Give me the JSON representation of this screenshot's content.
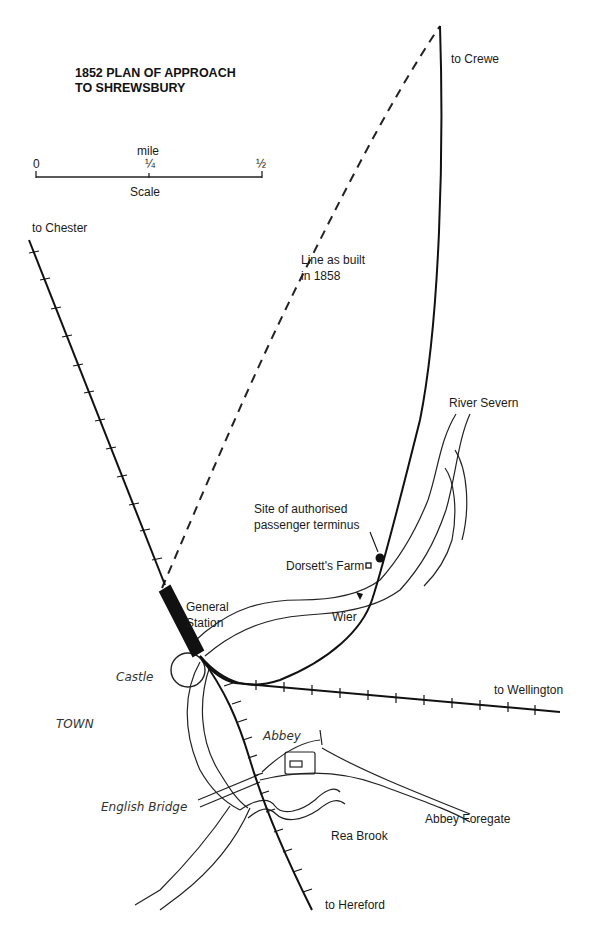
{
  "title": {
    "line1": "1852 PLAN OF APPROACH",
    "line2": "TO SHREWSBURY"
  },
  "scale": {
    "unit_label": "mile",
    "ticks": [
      "0",
      "¼",
      "½"
    ],
    "caption": "Scale"
  },
  "labels": {
    "to_crewe": "to Crewe",
    "to_chester": "to Chester",
    "line_as_built_1": "Line as built",
    "line_as_built_2": "in 1858",
    "river_severn": "River Severn",
    "terminus_1": "Site of authorised",
    "terminus_2": "passenger terminus",
    "dorsetts_farm": "Dorsett's Farm",
    "general_1": "General",
    "general_2": "Station",
    "wier": "Wier",
    "castle": "Castle",
    "to_wellington": "to Wellington",
    "town": "TOWN",
    "abbey": "Abbey",
    "english_bridge": "English Bridge",
    "abbey_foregate": "Abbey Foregate",
    "rea_brook": "Rea Brook",
    "to_hereford": "to Hereford"
  },
  "colors": {
    "ink": "#1a1a1a",
    "background": "#ffffff",
    "river_fill": "#f4f4f4"
  }
}
